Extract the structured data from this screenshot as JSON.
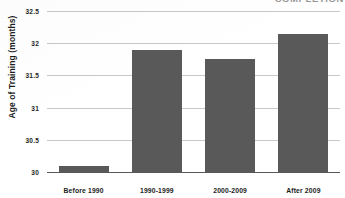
{
  "chart_data": {
    "type": "bar",
    "title": "COMPLETION",
    "title_note": "top of title is cropped off the top edge of the image; only the tail of the word is visible",
    "xlabel": "",
    "ylabel": "Age of Training (months)",
    "categories": [
      "Before 1990",
      "1990-1999",
      "2000-2009",
      "After 2009"
    ],
    "values": [
      30.1,
      31.9,
      31.75,
      32.15
    ],
    "ylim": [
      30,
      32.5
    ],
    "ytick_labels": [
      "32.5",
      "32",
      "31.5",
      "31",
      "30.5",
      "30"
    ],
    "ytick_values": [
      32.5,
      32,
      31.5,
      31,
      30.5,
      30
    ],
    "grid": true,
    "legend": false,
    "series": [
      {
        "name": "Age of Training",
        "values": [
          30.1,
          31.9,
          31.75,
          32.15
        ]
      }
    ]
  },
  "colors": {
    "bar": "#595959",
    "gridline": "#c8c8c8",
    "axis": "#585858",
    "text": "#1d1d1d",
    "background": "#ffffff"
  }
}
